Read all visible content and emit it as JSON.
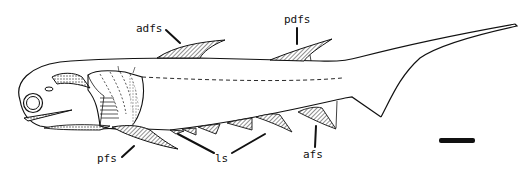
{
  "figure": {
    "colors": {
      "ink": "#111111",
      "background": "#ffffff",
      "hatch": "#555555"
    },
    "labels": {
      "adfs": "adfs",
      "pdfs": "pdfs",
      "pfs": "pfs",
      "ls": "ls",
      "afs": "afs"
    },
    "scale_bar": {
      "shown": true
    }
  }
}
